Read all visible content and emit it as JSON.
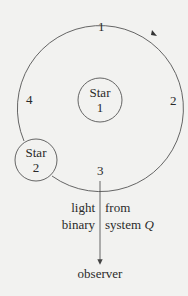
{
  "diagram": {
    "orbit_labels": [
      "1",
      "2",
      "3",
      "4"
    ],
    "star1": {
      "line1": "Star",
      "line2": "1"
    },
    "star2": {
      "line1": "Star",
      "line2": "2"
    },
    "beam": {
      "left_line1": "light",
      "left_line2": "binary",
      "right_line1": "from",
      "right_line2_text": "system ",
      "right_line2_italic": "Q"
    },
    "observer": "observer",
    "colors": {
      "line": "#555555",
      "text": "#2a2a2a",
      "background": "#f2f2f0"
    }
  }
}
